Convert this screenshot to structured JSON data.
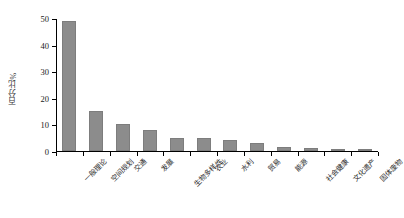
{
  "chart_data": {
    "type": "bar",
    "title": "",
    "subtitle": "",
    "xlabel": "",
    "ylabel": "百分比%",
    "ylim": [
      0,
      50
    ],
    "yticks": [
      0,
      10,
      20,
      30,
      40,
      50
    ],
    "grid": false,
    "legend": null,
    "bar_color": "#8c8c8c",
    "axis_color": "#000000",
    "background": "#ffffff",
    "categories": [
      "一般理论",
      "空间规划",
      "交通",
      "发展",
      "生物多样性",
      "农业",
      "水利",
      "贸易",
      "能源",
      "社会健康",
      "文化遗产",
      "固体废物"
    ],
    "values": [
      49,
      15,
      10,
      8,
      5,
      5,
      4,
      3,
      1.5,
      1,
      0.8,
      0.3
    ]
  }
}
